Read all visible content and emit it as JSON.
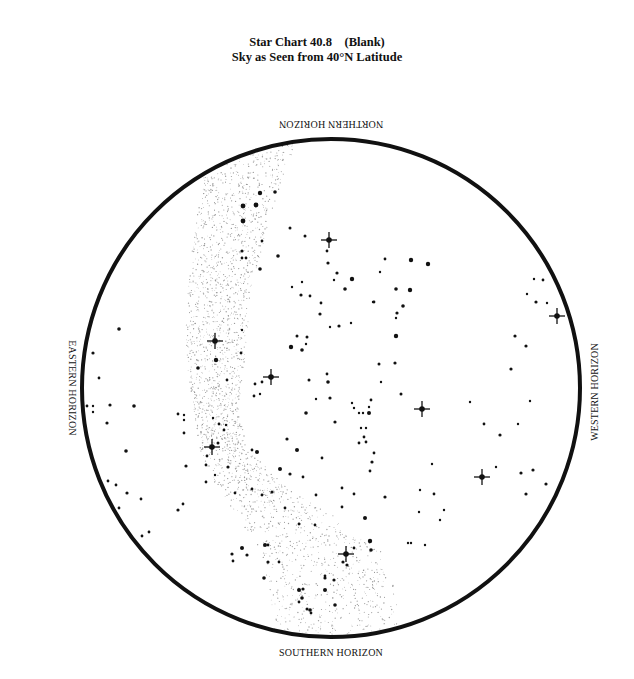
{
  "title": {
    "line1": "Star Chart 40.8    (Blank)",
    "line2": "Sky as Seen from 40°N Latitude"
  },
  "horizons": {
    "north": "NORTHERN HORIZON",
    "south": "SOUTHERN HORIZON",
    "east": "EASTERN HORIZON",
    "west": "WESTERN HORIZON"
  },
  "chart": {
    "center": [
      331,
      388
    ],
    "radius": 249,
    "border_color": "#111111",
    "star_color": "#111111",
    "milky_way_color": "#9a9a9a"
  },
  "bright_stars": [
    [
      329,
      240
    ],
    [
      215,
      341
    ],
    [
      271,
      377
    ],
    [
      422,
      409
    ],
    [
      212,
      447
    ],
    [
      482,
      477
    ],
    [
      346,
      554
    ],
    [
      557,
      316
    ]
  ],
  "stars": [
    [
      260,
      193,
      2.2
    ],
    [
      275,
      192,
      1.8
    ],
    [
      243,
      206,
      2.4
    ],
    [
      256,
      205,
      2.4
    ],
    [
      243,
      221,
      2.4
    ],
    [
      290,
      228,
      1.5
    ],
    [
      262,
      241,
      1.4
    ],
    [
      242,
      251,
      1.6
    ],
    [
      242,
      258,
      1.4
    ],
    [
      246,
      258,
      1.4
    ],
    [
      278,
      256,
      1.8
    ],
    [
      260,
      269,
      1.8
    ],
    [
      302,
      282,
      1.2
    ],
    [
      305,
      236,
      1.5
    ],
    [
      327,
      251,
      1.4
    ],
    [
      328,
      263,
      1.6
    ],
    [
      337,
      273,
      1.6
    ],
    [
      334,
      280,
      1.2
    ],
    [
      352,
      279,
      2.2
    ],
    [
      345,
      289,
      1.8
    ],
    [
      385,
      259,
      1.4
    ],
    [
      380,
      272,
      1.2
    ],
    [
      411,
      260,
      2.2
    ],
    [
      428,
      264,
      2.2
    ],
    [
      374,
      302,
      1.4
    ],
    [
      410,
      290,
      2.2
    ],
    [
      396,
      289,
      1.8
    ],
    [
      403,
      306,
      1.8
    ],
    [
      396,
      318,
      1.2
    ],
    [
      397,
      313,
      1.6
    ],
    [
      396,
      336,
      2.2
    ],
    [
      373,
      302,
      1.2
    ],
    [
      301,
      295,
      1.6
    ],
    [
      292,
      287,
      1.2
    ],
    [
      310,
      296,
      1.4
    ],
    [
      321,
      303,
      1.4
    ],
    [
      320,
      314,
      1.6
    ],
    [
      330,
      327,
      1.2
    ],
    [
      339,
      326,
      1.6
    ],
    [
      351,
      323,
      1.2
    ],
    [
      297,
      336,
      1.5
    ],
    [
      307,
      337,
      1.5
    ],
    [
      291,
      347,
      2.2
    ],
    [
      302,
      350,
      1.8
    ],
    [
      306,
      344,
      1.2
    ],
    [
      241,
      353,
      1.4
    ],
    [
      216,
      360,
      2.2
    ],
    [
      198,
      368,
      1.8
    ],
    [
      227,
      380,
      1.4
    ],
    [
      242,
      330,
      1.2
    ],
    [
      255,
      384,
      1.4
    ],
    [
      262,
      382,
      1.4
    ],
    [
      254,
      396,
      1.4
    ],
    [
      260,
      394,
      1.2
    ],
    [
      309,
      380,
      1.5
    ],
    [
      327,
      374,
      1.4
    ],
    [
      328,
      382,
      1.8
    ],
    [
      330,
      398,
      1.6
    ],
    [
      316,
      399,
      1.2
    ],
    [
      379,
      364,
      1.5
    ],
    [
      395,
      363,
      1.6
    ],
    [
      381,
      382,
      1.2
    ],
    [
      401,
      394,
      1.5
    ],
    [
      352,
      403,
      1.2
    ],
    [
      354,
      408,
      1.2
    ],
    [
      359,
      413,
      1.2
    ],
    [
      363,
      413,
      1.2
    ],
    [
      371,
      400,
      1.4
    ],
    [
      369,
      407,
      1.2
    ],
    [
      369,
      413,
      2
    ],
    [
      306,
      413,
      1.8
    ],
    [
      335,
      422,
      1.6
    ],
    [
      361,
      428,
      1.2
    ],
    [
      366,
      428,
      1.2
    ],
    [
      364,
      437,
      1.4
    ],
    [
      359,
      443,
      1.4
    ],
    [
      366,
      442,
      1.4
    ],
    [
      374,
      453,
      1.4
    ],
    [
      372,
      462,
      1.6
    ],
    [
      370,
      471,
      1.4
    ],
    [
      297,
      450,
      2
    ],
    [
      322,
      458,
      1.4
    ],
    [
      290,
      474,
      1.6
    ],
    [
      272,
      492,
      1.6
    ],
    [
      316,
      495,
      1.4
    ],
    [
      342,
      488,
      1.4
    ],
    [
      354,
      494,
      1.4
    ],
    [
      235,
      493,
      1.4
    ],
    [
      285,
      508,
      1.4
    ],
    [
      342,
      507,
      1.4
    ],
    [
      385,
      497,
      1.6
    ],
    [
      419,
      512,
      1.2
    ],
    [
      408,
      543,
      1.2
    ],
    [
      299,
      524,
      1.4
    ],
    [
      315,
      525,
      1.4
    ],
    [
      365,
      518,
      2
    ],
    [
      370,
      541,
      2.2
    ],
    [
      371,
      550,
      1.8
    ],
    [
      354,
      548,
      1.4
    ],
    [
      343,
      562,
      1.6
    ],
    [
      119,
      329,
      1.8
    ],
    [
      93,
      353,
      1.6
    ],
    [
      99,
      378,
      1.4
    ],
    [
      87,
      406,
      1.4
    ],
    [
      93,
      406,
      1.2
    ],
    [
      93,
      412,
      1.2
    ],
    [
      110,
      405,
      1.6
    ],
    [
      134,
      406,
      1.8
    ],
    [
      107,
      423,
      1.6
    ],
    [
      126,
      451,
      1.8
    ],
    [
      108,
      481,
      1.4
    ],
    [
      116,
      485,
      1.4
    ],
    [
      127,
      493,
      1.6
    ],
    [
      141,
      499,
      1.4
    ],
    [
      119,
      508,
      1.4
    ],
    [
      142,
      536,
      1.4
    ],
    [
      149,
      532,
      1.4
    ],
    [
      178,
      414,
      1.4
    ],
    [
      184,
      415,
      1.2
    ],
    [
      184,
      420,
      1.2
    ],
    [
      184,
      433,
      1.4
    ],
    [
      186,
      466,
      1.6
    ],
    [
      178,
      510,
      1.6
    ],
    [
      183,
      504,
      1.4
    ],
    [
      213,
      418,
      1.2
    ],
    [
      219,
      424,
      1.4
    ],
    [
      226,
      425,
      1.2
    ],
    [
      224,
      430,
      1.4
    ],
    [
      218,
      443,
      1.5
    ],
    [
      207,
      456,
      1.4
    ],
    [
      206,
      465,
      1.4
    ],
    [
      206,
      482,
      1.4
    ],
    [
      215,
      475,
      1.2
    ],
    [
      228,
      467,
      1.6
    ],
    [
      252,
      450,
      1.4
    ],
    [
      252,
      489,
      1.4
    ],
    [
      257,
      452,
      2
    ],
    [
      262,
      495,
      1.4
    ],
    [
      280,
      469,
      2
    ],
    [
      287,
      439,
      1.6
    ],
    [
      303,
      477,
      1.4
    ],
    [
      232,
      554,
      1.6
    ],
    [
      242,
      548,
      2
    ],
    [
      247,
      555,
      1.6
    ],
    [
      265,
      545,
      2
    ],
    [
      233,
      561,
      1.4
    ],
    [
      268,
      562,
      1.6
    ],
    [
      279,
      562,
      1.4
    ],
    [
      264,
      578,
      1.8
    ],
    [
      268,
      545,
      1.4
    ],
    [
      299,
      590,
      2
    ],
    [
      303,
      589,
      1.6
    ],
    [
      302,
      598,
      1.8
    ],
    [
      299,
      602,
      1.4
    ],
    [
      310,
      610,
      1.8
    ],
    [
      325,
      590,
      2
    ],
    [
      325,
      578,
      1.6
    ],
    [
      335,
      605,
      1.8
    ],
    [
      334,
      580,
      1.6
    ],
    [
      325,
      576,
      1.4
    ],
    [
      347,
      565,
      1.6
    ],
    [
      307,
      609,
      1.5
    ],
    [
      311,
      613,
      1.4
    ],
    [
      534,
      279,
      1.2
    ],
    [
      543,
      280,
      1.4
    ],
    [
      527,
      294,
      1.2
    ],
    [
      536,
      302,
      1.6
    ],
    [
      547,
      303,
      1.2
    ],
    [
      515,
      336,
      1.6
    ],
    [
      526,
      346,
      1.6
    ],
    [
      511,
      369,
      1.6
    ],
    [
      470,
      402,
      1.2
    ],
    [
      530,
      401,
      1.2
    ],
    [
      484,
      424,
      1.4
    ],
    [
      518,
      424,
      1.2
    ],
    [
      500,
      435,
      1.6
    ],
    [
      521,
      473,
      1.6
    ],
    [
      533,
      470,
      1.6
    ],
    [
      546,
      484,
      1.6
    ],
    [
      526,
      494,
      1.6
    ],
    [
      496,
      467,
      1.2
    ],
    [
      432,
      464,
      1.2
    ],
    [
      420,
      490,
      1.2
    ],
    [
      434,
      494,
      1.4
    ],
    [
      411,
      543,
      1.2
    ],
    [
      444,
      510,
      1.2
    ],
    [
      440,
      520,
      1.2
    ],
    [
      425,
      545,
      1.2
    ]
  ]
}
